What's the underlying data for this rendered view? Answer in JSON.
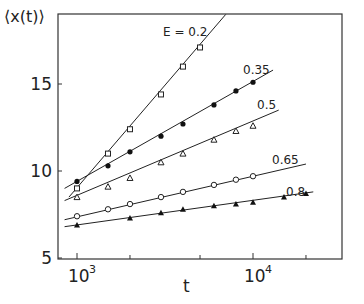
{
  "chart_data": {
    "type": "line",
    "title": "",
    "xlabel": "t",
    "ylabel": "⟨x(t)⟩",
    "xscale": "log",
    "xlim": [
      700,
      30000
    ],
    "ylim": [
      5,
      19
    ],
    "x_ticks": [
      {
        "value": 1000,
        "label": "10",
        "sup": "3"
      },
      {
        "value": 10000,
        "label": "10",
        "sup": "4"
      }
    ],
    "x_minor_ticks": [
      2000,
      5000,
      20000
    ],
    "y_ticks": [
      {
        "value": 5,
        "label": "5"
      },
      {
        "value": 10,
        "label": "10"
      },
      {
        "value": 15,
        "label": "15"
      }
    ],
    "grid": false,
    "legend": "inline labels",
    "series": [
      {
        "name": "E = 0.2",
        "label": "E = 0.2",
        "marker": "open-square",
        "x": [
          1000,
          1500,
          2000,
          3000,
          4000,
          5000
        ],
        "values": [
          9.0,
          11.0,
          12.4,
          14.4,
          16.0,
          17.1
        ],
        "fit": {
          "x0": 900,
          "y0": 8.5,
          "x1": 7000,
          "y1": 19.0
        }
      },
      {
        "name": "E = 0.35",
        "label": "0.35",
        "marker": "filled-circle",
        "x": [
          1000,
          1500,
          2000,
          3000,
          4000,
          6000,
          8000,
          10000
        ],
        "values": [
          9.4,
          10.3,
          11.1,
          12.0,
          12.7,
          13.8,
          14.6,
          15.1
        ],
        "fit": {
          "x0": 850,
          "y0": 9.0,
          "x1": 13000,
          "y1": 15.8
        }
      },
      {
        "name": "E = 0.5",
        "label": "0.5",
        "marker": "open-triangle",
        "x": [
          1000,
          1500,
          2000,
          3000,
          4000,
          6000,
          8000,
          10000
        ],
        "values": [
          8.5,
          9.1,
          9.6,
          10.5,
          11.0,
          11.8,
          12.3,
          12.6
        ],
        "fit": {
          "x0": 850,
          "y0": 8.3,
          "x1": 14000,
          "y1": 13.5
        }
      },
      {
        "name": "E = 0.65",
        "label": "0.65",
        "marker": "open-circle",
        "x": [
          1000,
          1500,
          2000,
          3000,
          4000,
          6000,
          8000,
          10000
        ],
        "values": [
          7.4,
          7.8,
          8.1,
          8.5,
          8.8,
          9.2,
          9.5,
          9.7
        ],
        "fit": {
          "x0": 850,
          "y0": 7.2,
          "x1": 20000,
          "y1": 10.4
        }
      },
      {
        "name": "E = 0.8",
        "label": "0.8",
        "marker": "filled-triangle",
        "x": [
          1000,
          2000,
          3000,
          4000,
          6000,
          8000,
          10000,
          15000,
          20000
        ],
        "values": [
          6.9,
          7.3,
          7.6,
          7.8,
          8.0,
          8.1,
          8.2,
          8.5,
          8.7
        ],
        "fit": {
          "x0": 850,
          "y0": 6.8,
          "x1": 22000,
          "y1": 8.8
        }
      }
    ]
  }
}
